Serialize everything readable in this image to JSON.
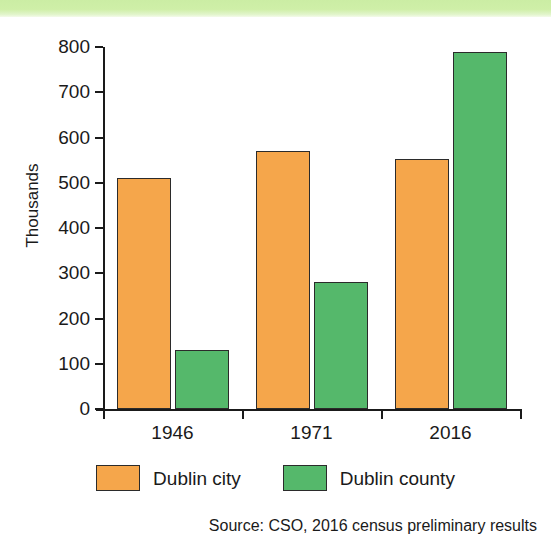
{
  "banner": {
    "color": "#cfefa8"
  },
  "chart_data": {
    "type": "bar",
    "title": "",
    "xlabel": "",
    "ylabel": "Thousands",
    "ylim": [
      0,
      800
    ],
    "ytick_step": 100,
    "grid": false,
    "legend_position": "bottom",
    "categories": [
      "1946",
      "1971",
      "2016"
    ],
    "ytick_labels": [
      "800",
      "700",
      "600",
      "500",
      "400",
      "300",
      "200",
      "100",
      "0"
    ],
    "series": [
      {
        "name": "Dublin city",
        "color": "#f5a64b",
        "values": [
          510,
          570,
          553
        ]
      },
      {
        "name": "Dublin county",
        "color": "#55b86b",
        "values": [
          130,
          280,
          790
        ]
      }
    ],
    "source_note": "Source: CSO, 2016 census preliminary results"
  }
}
